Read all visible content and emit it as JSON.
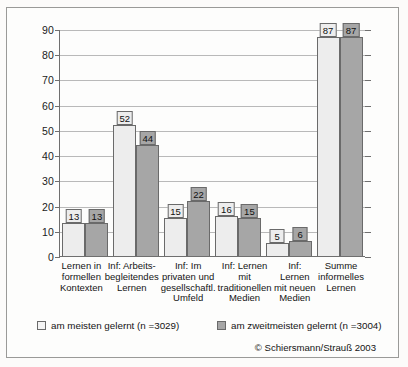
{
  "chart_data": {
    "type": "bar",
    "title": "",
    "xlabel": "",
    "ylabel": "",
    "ylim": [
      0,
      90
    ],
    "ytick_step": 10,
    "yticks": [
      0,
      10,
      20,
      30,
      40,
      50,
      60,
      70,
      80,
      90
    ],
    "grid": true,
    "legend_position": "bottom",
    "categories": [
      "Lernen in formellen Kontexten",
      "Inf: Arbeits-begleitendes Lernen",
      "Inf: Im privaten und gesellschaftl. Umfeld",
      "Inf: Lernen mit traditionellen Medien",
      "Inf: Lernen mit neuen Medien",
      "Summe informelles Lernen"
    ],
    "category_lines": [
      [
        "Lernen in",
        "formellen",
        "Kontexten"
      ],
      [
        "Inf: Arbeits-",
        "begleitendes",
        "Lernen"
      ],
      [
        "Inf: Im",
        "privaten und",
        "gesellschaftl.",
        "Umfeld"
      ],
      [
        "Inf: Lernen",
        "mit",
        "traditionellen",
        "Medien"
      ],
      [
        "Inf: Lernen",
        "mit neuen",
        "Medien"
      ],
      [
        "Summe",
        "informelles",
        "Lernen"
      ]
    ],
    "series": [
      {
        "name": "am meisten gelernt (n =3029)",
        "color": "#ededed",
        "values": [
          13,
          52,
          15,
          16,
          5,
          87
        ]
      },
      {
        "name": "am zweitmeisten gelernt (n =3004)",
        "color": "#a6a6a6",
        "values": [
          13,
          44,
          22,
          15,
          6,
          87
        ]
      }
    ],
    "annotations": [
      "© Schiersmann/Strauß 2003"
    ]
  },
  "legend": {
    "item1": "am meisten gelernt (n =3029)",
    "item2": "am zweitmeisten gelernt (n =3004)"
  },
  "credit": "© Schiersmann/Strauß 2003",
  "axis": {
    "y_labels": [
      "90",
      "80",
      "70",
      "60",
      "50",
      "40",
      "30",
      "20",
      "10",
      "0"
    ]
  }
}
